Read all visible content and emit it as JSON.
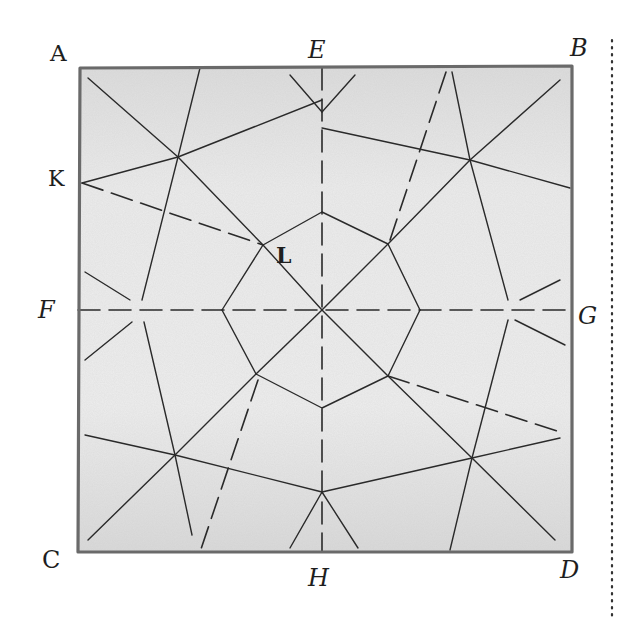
{
  "diagram": {
    "paper_color": "#e9e9e9",
    "edge_color": "#6a6a6a",
    "crease_color": "#2a2a2a",
    "dotted_line_color": "#333333",
    "labels": {
      "A": "A",
      "B": "B",
      "C": "C",
      "D": "D",
      "E": "E",
      "F": "F",
      "G": "G",
      "H": "H",
      "K": "K",
      "L": "L"
    },
    "points": {
      "A": [
        80,
        68
      ],
      "B": [
        572,
        66
      ],
      "C": [
        78,
        552
      ],
      "D": [
        572,
        552
      ],
      "E": [
        322,
        68
      ],
      "F": [
        78,
        310
      ],
      "G": [
        572,
        310
      ],
      "H": [
        322,
        552
      ],
      "K": [
        82,
        183
      ],
      "L": [
        263,
        245
      ],
      "O": [
        322,
        310
      ]
    },
    "creases": {
      "mountain_dashed": [
        [
          [
            82,
            183
          ],
          [
            263,
            245
          ]
        ],
        [
          [
            322,
            68
          ],
          [
            322,
            552
          ]
        ],
        [
          [
            78,
            310
          ],
          [
            572,
            310
          ]
        ],
        [
          [
            446,
            72
          ],
          [
            390,
            240
          ]
        ],
        [
          [
            258,
            380
          ],
          [
            200,
            552
          ]
        ],
        [
          [
            388,
            376
          ],
          [
            560,
            432
          ]
        ]
      ],
      "valley_solid": [
        [
          [
            88,
            78
          ],
          [
            178,
            157
          ]
        ],
        [
          [
            200,
            68
          ],
          [
            178,
            157
          ]
        ],
        [
          [
            82,
            183
          ],
          [
            178,
            157
          ]
        ],
        [
          [
            178,
            157
          ],
          [
            322,
            100
          ]
        ],
        [
          [
            178,
            157
          ],
          [
            263,
            245
          ]
        ],
        [
          [
            178,
            157
          ],
          [
            142,
            300
          ]
        ],
        [
          [
            290,
            75
          ],
          [
            322,
            112
          ]
        ],
        [
          [
            355,
            75
          ],
          [
            322,
            112
          ]
        ],
        [
          [
            322,
            128
          ],
          [
            470,
            160
          ]
        ],
        [
          [
            452,
            72
          ],
          [
            470,
            160
          ]
        ],
        [
          [
            560,
            80
          ],
          [
            470,
            160
          ]
        ],
        [
          [
            470,
            160
          ],
          [
            570,
            188
          ]
        ],
        [
          [
            470,
            160
          ],
          [
            388,
            244
          ]
        ],
        [
          [
            470,
            160
          ],
          [
            508,
            300
          ]
        ],
        [
          [
            322,
            212
          ],
          [
            263,
            245
          ]
        ],
        [
          [
            322,
            212
          ],
          [
            388,
            244
          ]
        ],
        [
          [
            263,
            245
          ],
          [
            222,
            310
          ]
        ],
        [
          [
            388,
            244
          ],
          [
            420,
            310
          ]
        ],
        [
          [
            222,
            310
          ],
          [
            256,
            374
          ]
        ],
        [
          [
            420,
            310
          ],
          [
            388,
            376
          ]
        ],
        [
          [
            256,
            374
          ],
          [
            322,
            408
          ]
        ],
        [
          [
            388,
            376
          ],
          [
            322,
            408
          ]
        ],
        [
          [
            263,
            245
          ],
          [
            322,
            310
          ]
        ],
        [
          [
            388,
            244
          ],
          [
            322,
            310
          ]
        ],
        [
          [
            256,
            374
          ],
          [
            322,
            310
          ]
        ],
        [
          [
            388,
            376
          ],
          [
            322,
            310
          ]
        ],
        [
          [
            85,
            272
          ],
          [
            130,
            300
          ]
        ],
        [
          [
            85,
            360
          ],
          [
            132,
            322
          ]
        ],
        [
          [
            144,
            322
          ],
          [
            175,
            455
          ]
        ],
        [
          [
            520,
            300
          ],
          [
            560,
            280
          ]
        ],
        [
          [
            515,
            320
          ],
          [
            565,
            345
          ]
        ],
        [
          [
            508,
            320
          ],
          [
            472,
            458
          ]
        ],
        [
          [
            256,
            374
          ],
          [
            175,
            455
          ]
        ],
        [
          [
            175,
            455
          ],
          [
            88,
            540
          ]
        ],
        [
          [
            175,
            455
          ],
          [
            192,
            535
          ]
        ],
        [
          [
            85,
            435
          ],
          [
            175,
            455
          ]
        ],
        [
          [
            175,
            455
          ],
          [
            322,
            492
          ]
        ],
        [
          [
            322,
            492
          ],
          [
            472,
            458
          ]
        ],
        [
          [
            472,
            458
          ],
          [
            560,
            438
          ]
        ],
        [
          [
            388,
            376
          ],
          [
            472,
            458
          ]
        ],
        [
          [
            472,
            458
          ],
          [
            555,
            540
          ]
        ],
        [
          [
            472,
            458
          ],
          [
            450,
            550
          ]
        ],
        [
          [
            322,
            492
          ],
          [
            290,
            548
          ]
        ],
        [
          [
            322,
            492
          ],
          [
            358,
            548
          ]
        ]
      ]
    }
  }
}
